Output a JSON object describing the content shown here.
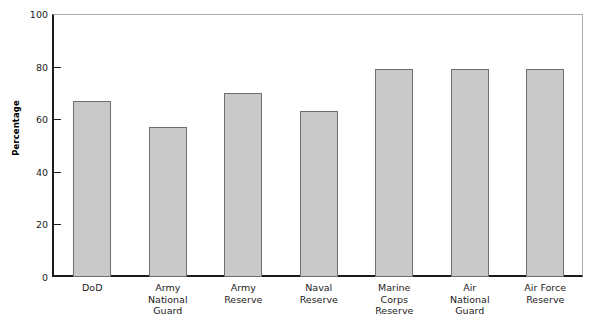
{
  "chart_data": {
    "type": "bar",
    "title": "",
    "xlabel": "",
    "ylabel": "Percentage",
    "ylim": [
      0,
      100
    ],
    "yticks": [
      0,
      20,
      40,
      60,
      80,
      100
    ],
    "grid": false,
    "legend": "none",
    "categories": [
      "DoD",
      "Army National Guard",
      "Army Reserve",
      "Naval Reserve",
      "Marine Corps Reserve",
      "Air National Guard",
      "Air Force Reserve"
    ],
    "category_lines": [
      [
        "DoD"
      ],
      [
        "Army",
        "National",
        "Guard"
      ],
      [
        "Army",
        "Reserve"
      ],
      [
        "Naval",
        "Reserve"
      ],
      [
        "Marine",
        "Corps",
        "Reserve"
      ],
      [
        "Air",
        "National",
        "Guard"
      ],
      [
        "Air Force",
        "Reserve"
      ]
    ],
    "values": [
      67,
      57,
      70,
      63,
      79,
      79,
      79
    ],
    "colors": {
      "bar_fill": "#c9c9c9",
      "bar_edge": "#6e6e6e",
      "axis": "#1b1b1b",
      "frame": "#aeaeae",
      "background": "#ffffff"
    }
  }
}
